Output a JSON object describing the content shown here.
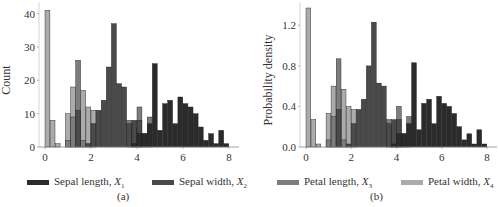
{
  "colors": {
    "sepal_length": "#2b2b2b",
    "sepal_width": "#4a4a4a",
    "petal_length": "#7d7d7d",
    "petal_width": "#ababab"
  },
  "legend": [
    {
      "key": "sepal_length",
      "label": "Sepal length, ",
      "var": "X",
      "sub": "1"
    },
    {
      "key": "sepal_width",
      "label": "Sepal width, ",
      "var": "X",
      "sub": "2"
    },
    {
      "key": "petal_length",
      "label": "Petal length, ",
      "var": "X",
      "sub": "3"
    },
    {
      "key": "petal_width",
      "label": "Petal width, ",
      "var": "X",
      "sub": "4"
    }
  ],
  "panels": {
    "a": "(a)",
    "b": "(b)"
  },
  "chart_data": [
    {
      "type": "bar",
      "title": "",
      "panel": "(a)",
      "xlabel": "",
      "ylabel": "Count",
      "xlim": [
        0,
        8
      ],
      "ylim": [
        0,
        42
      ],
      "xticks": [
        0,
        2,
        4,
        6,
        8
      ],
      "yticks": [
        0,
        10,
        20,
        30,
        40
      ],
      "bin_width": 0.25,
      "grid": false,
      "legend_position": "bottom",
      "series": [
        {
          "name": "Petal width, X4",
          "key": "petal_width",
          "bins": [
            [
              0.0,
              41
            ],
            [
              0.25,
              8
            ],
            [
              0.5,
              1
            ],
            [
              1.0,
              10
            ],
            [
              1.25,
              18
            ],
            [
              1.75,
              17
            ],
            [
              2.0,
              12
            ],
            [
              2.25,
              11
            ]
          ]
        },
        {
          "name": "Petal length, X3",
          "key": "petal_length",
          "bins": [
            [
              1.0,
              2
            ],
            [
              1.25,
              9
            ],
            [
              1.5,
              26
            ],
            [
              1.75,
              2
            ],
            [
              4.0,
              8
            ],
            [
              4.25,
              6
            ],
            [
              4.5,
              12
            ],
            [
              4.75,
              4
            ],
            [
              5.0,
              9
            ]
          ]
        },
        {
          "name": "Sepal width, X2",
          "key": "sepal_width",
          "bins": [
            [
              1.5,
              11
            ],
            [
              2.0,
              1
            ],
            [
              2.25,
              7
            ],
            [
              2.5,
              11
            ],
            [
              2.75,
              14
            ],
            [
              3.0,
              24
            ],
            [
              3.25,
              37
            ],
            [
              3.5,
              19
            ],
            [
              3.75,
              18
            ],
            [
              4.0,
              7
            ],
            [
              4.25,
              8
            ],
            [
              4.5,
              8
            ]
          ]
        },
        {
          "name": "Sepal length, X1",
          "key": "sepal_length",
          "bins": [
            [
              4.25,
              1
            ],
            [
              4.5,
              4
            ],
            [
              4.75,
              4
            ],
            [
              5.0,
              7
            ],
            [
              5.25,
              25
            ],
            [
              5.5,
              5
            ],
            [
              5.75,
              13
            ],
            [
              6.0,
              14
            ],
            [
              6.25,
              7
            ],
            [
              6.5,
              15
            ],
            [
              6.75,
              13
            ],
            [
              7.0,
              12
            ],
            [
              7.25,
              10
            ],
            [
              7.5,
              6
            ],
            [
              7.75,
              2
            ],
            [
              8.0,
              4
            ],
            [
              8.25,
              1
            ],
            [
              8.5,
              5
            ],
            [
              8.75,
              1
            ]
          ]
        }
      ]
    },
    {
      "type": "bar",
      "title": "",
      "panel": "(b)",
      "xlabel": "",
      "ylabel": "Probability density",
      "xlim": [
        0,
        8
      ],
      "ylim": [
        0,
        1.4
      ],
      "xticks": [
        0,
        2,
        4,
        6,
        8
      ],
      "yticks": [
        0.0,
        0.4,
        0.8,
        1.2
      ],
      "bin_width": 0.25,
      "grid": false,
      "legend_position": "bottom",
      "series": [
        {
          "name": "Petal width, X4",
          "key": "petal_width",
          "bins": [
            [
              0.0,
              1.37
            ],
            [
              0.25,
              0.27
            ],
            [
              0.5,
              0.03
            ],
            [
              1.0,
              0.33
            ],
            [
              1.25,
              0.6
            ],
            [
              1.75,
              0.57
            ],
            [
              2.0,
              0.4
            ],
            [
              2.25,
              0.37
            ]
          ]
        },
        {
          "name": "Petal length, X3",
          "key": "petal_length",
          "bins": [
            [
              1.0,
              0.07
            ],
            [
              1.25,
              0.3
            ],
            [
              1.5,
              0.87
            ],
            [
              1.75,
              0.07
            ],
            [
              4.0,
              0.27
            ],
            [
              4.25,
              0.2
            ],
            [
              4.5,
              0.4
            ],
            [
              4.75,
              0.13
            ],
            [
              5.0,
              0.3
            ]
          ]
        },
        {
          "name": "Sepal width, X2",
          "key": "sepal_width",
          "bins": [
            [
              1.5,
              0.37
            ],
            [
              2.0,
              0.03
            ],
            [
              2.25,
              0.23
            ],
            [
              2.5,
              0.37
            ],
            [
              2.75,
              0.47
            ],
            [
              3.0,
              0.8
            ],
            [
              3.25,
              1.23
            ],
            [
              3.5,
              0.63
            ],
            [
              3.75,
              0.6
            ],
            [
              4.0,
              0.23
            ],
            [
              4.25,
              0.27
            ],
            [
              4.5,
              0.27
            ]
          ]
        },
        {
          "name": "Sepal length, X1",
          "key": "sepal_length",
          "bins": [
            [
              4.25,
              0.03
            ],
            [
              4.5,
              0.13
            ],
            [
              4.75,
              0.13
            ],
            [
              5.0,
              0.23
            ],
            [
              5.25,
              0.83
            ],
            [
              5.5,
              0.17
            ],
            [
              5.75,
              0.43
            ],
            [
              6.0,
              0.47
            ],
            [
              6.25,
              0.23
            ],
            [
              6.5,
              0.5
            ],
            [
              6.75,
              0.43
            ],
            [
              7.0,
              0.4
            ],
            [
              7.25,
              0.33
            ],
            [
              7.5,
              0.2
            ],
            [
              7.75,
              0.07
            ],
            [
              8.0,
              0.13
            ],
            [
              8.25,
              0.03
            ],
            [
              8.5,
              0.17
            ],
            [
              8.75,
              0.03
            ]
          ]
        }
      ]
    }
  ]
}
